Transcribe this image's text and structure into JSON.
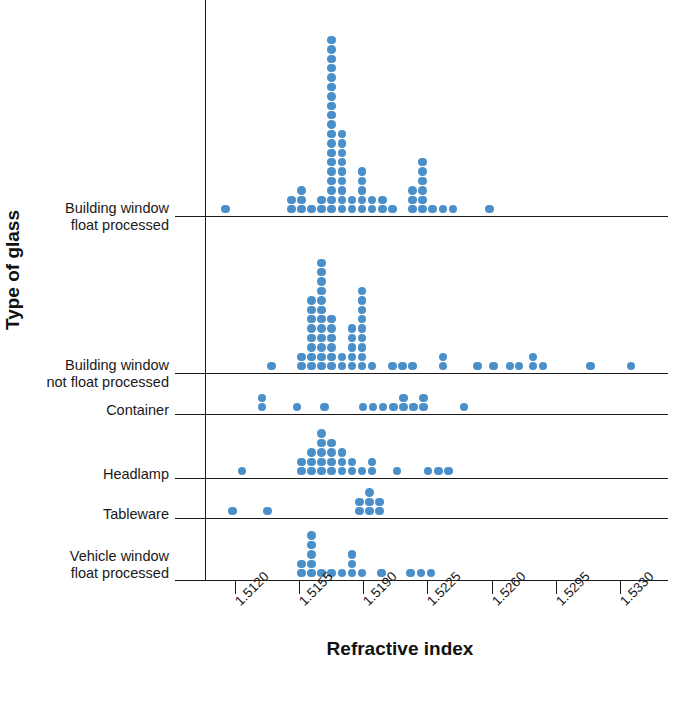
{
  "chart_data": {
    "type": "scatter",
    "plot_style": "dot-plot",
    "title": "",
    "xlabel": "Refractive index",
    "ylabel": "Type of glass",
    "grid": false,
    "legend": false,
    "dot_color": "#4a8fc9",
    "axis_color": "#1a1a1a",
    "background": "#ffffff",
    "xticks": [
      "1.5120",
      "1.5155",
      "1.5190",
      "1.5225",
      "1.5260",
      "1.5295",
      "1.5330"
    ],
    "xtick_values": [
      1.512,
      1.5155,
      1.519,
      1.5225,
      1.526,
      1.5295,
      1.533
    ],
    "xlim": [
      1.5105,
      1.5345
    ],
    "categories": [
      "Building window\nfloat processed",
      "Building window\nnot float processed",
      "Container",
      "Headlamp",
      "Tableware",
      "Vehicle window\nfloat processed"
    ],
    "series": [
      {
        "name": "Building window float processed",
        "bins": [
          {
            "x": 1.5115,
            "count": 1
          },
          {
            "x": 1.5151,
            "count": 2
          },
          {
            "x": 1.51565,
            "count": 3
          },
          {
            "x": 1.5162,
            "count": 1
          },
          {
            "x": 1.51675,
            "count": 2
          },
          {
            "x": 1.5173,
            "count": 19
          },
          {
            "x": 1.51785,
            "count": 9
          },
          {
            "x": 1.5184,
            "count": 2
          },
          {
            "x": 1.51895,
            "count": 5
          },
          {
            "x": 1.5195,
            "count": 2
          },
          {
            "x": 1.52005,
            "count": 2
          },
          {
            "x": 1.5206,
            "count": 1
          },
          {
            "x": 1.5217,
            "count": 3
          },
          {
            "x": 1.52225,
            "count": 6
          },
          {
            "x": 1.5228,
            "count": 1
          },
          {
            "x": 1.52335,
            "count": 1
          },
          {
            "x": 1.5239,
            "count": 1
          },
          {
            "x": 1.5259,
            "count": 1
          }
        ]
      },
      {
        "name": "Building window not float processed",
        "bins": [
          {
            "x": 1.514,
            "count": 1
          },
          {
            "x": 1.51565,
            "count": 2
          },
          {
            "x": 1.5162,
            "count": 8
          },
          {
            "x": 1.51675,
            "count": 12
          },
          {
            "x": 1.5173,
            "count": 6
          },
          {
            "x": 1.51785,
            "count": 2
          },
          {
            "x": 1.5184,
            "count": 5
          },
          {
            "x": 1.51895,
            "count": 9
          },
          {
            "x": 1.5195,
            "count": 1
          },
          {
            "x": 1.5206,
            "count": 1
          },
          {
            "x": 1.52115,
            "count": 1
          },
          {
            "x": 1.5217,
            "count": 1
          },
          {
            "x": 1.52335,
            "count": 2
          },
          {
            "x": 1.52525,
            "count": 1
          },
          {
            "x": 1.5261,
            "count": 1
          },
          {
            "x": 1.527,
            "count": 1
          },
          {
            "x": 1.5275,
            "count": 1
          },
          {
            "x": 1.52825,
            "count": 2
          },
          {
            "x": 1.5288,
            "count": 1
          },
          {
            "x": 1.5314,
            "count": 1
          },
          {
            "x": 1.5336,
            "count": 1
          }
        ]
      },
      {
        "name": "Container",
        "bins": [
          {
            "x": 1.5135,
            "count": 2
          },
          {
            "x": 1.5154,
            "count": 1
          },
          {
            "x": 1.5169,
            "count": 1
          },
          {
            "x": 1.519,
            "count": 1
          },
          {
            "x": 1.51955,
            "count": 1
          },
          {
            "x": 1.5201,
            "count": 1
          },
          {
            "x": 1.52065,
            "count": 1
          },
          {
            "x": 1.5212,
            "count": 2
          },
          {
            "x": 1.52175,
            "count": 1
          },
          {
            "x": 1.5223,
            "count": 2
          },
          {
            "x": 1.5245,
            "count": 1
          }
        ]
      },
      {
        "name": "Headlamp",
        "bins": [
          {
            "x": 1.5124,
            "count": 1
          },
          {
            "x": 1.51565,
            "count": 2
          },
          {
            "x": 1.5162,
            "count": 3
          },
          {
            "x": 1.51675,
            "count": 5
          },
          {
            "x": 1.5173,
            "count": 4
          },
          {
            "x": 1.51785,
            "count": 3
          },
          {
            "x": 1.5184,
            "count": 2
          },
          {
            "x": 1.51895,
            "count": 1
          },
          {
            "x": 1.5195,
            "count": 2
          },
          {
            "x": 1.52085,
            "count": 1
          },
          {
            "x": 1.52255,
            "count": 1
          },
          {
            "x": 1.5231,
            "count": 1
          },
          {
            "x": 1.52365,
            "count": 1
          }
        ]
      },
      {
        "name": "Tableware",
        "bins": [
          {
            "x": 1.5119,
            "count": 1
          },
          {
            "x": 1.5138,
            "count": 1
          },
          {
            "x": 1.5188,
            "count": 2
          },
          {
            "x": 1.51935,
            "count": 3
          },
          {
            "x": 1.5199,
            "count": 2
          }
        ]
      },
      {
        "name": "Vehicle window float processed",
        "bins": [
          {
            "x": 1.51565,
            "count": 2
          },
          {
            "x": 1.5162,
            "count": 5
          },
          {
            "x": 1.51675,
            "count": 1
          },
          {
            "x": 1.5173,
            "count": 1
          },
          {
            "x": 1.51785,
            "count": 1
          },
          {
            "x": 1.5184,
            "count": 3
          },
          {
            "x": 1.51895,
            "count": 1
          },
          {
            "x": 1.52,
            "count": 1
          },
          {
            "x": 1.5216,
            "count": 1
          },
          {
            "x": 1.52215,
            "count": 1
          },
          {
            "x": 1.5227,
            "count": 1
          }
        ]
      }
    ]
  }
}
